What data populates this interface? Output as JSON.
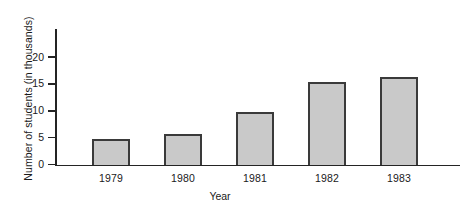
{
  "chart_data": {
    "type": "bar",
    "title": "",
    "subtitle": "",
    "xlabel": "Year",
    "ylabel": "Number of students (in thousands)",
    "categories": [
      "1979",
      "1980",
      "1981",
      "1982",
      "1983"
    ],
    "values": [
      4.8,
      5.6,
      9.7,
      15.4,
      16.3
    ],
    "ylim": [
      0,
      22
    ],
    "yticks": [
      0,
      5,
      10,
      15,
      20
    ],
    "ytick_labels": [
      "0",
      "5",
      "10",
      "15",
      "20"
    ],
    "grid": false,
    "legend": false,
    "legend_position": "none",
    "bar_fill_color": "#c9c9c9",
    "bar_edge_color": "#3a3a3a",
    "axis_color": "#242424",
    "background_color": "#ffffff"
  }
}
